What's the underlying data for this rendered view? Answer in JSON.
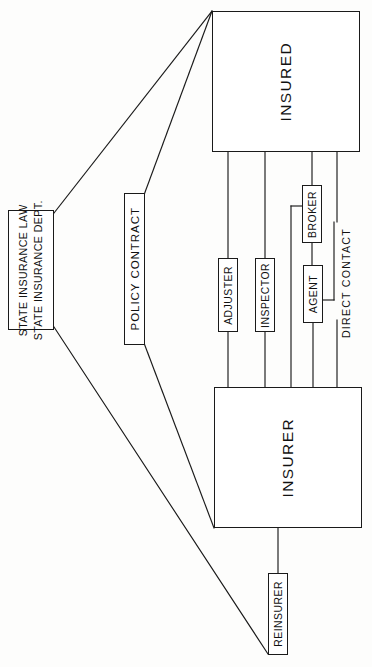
{
  "diagram": {
    "stroke_color": "#1a1a1a",
    "background_color": "#fdfdfc",
    "nodes": {
      "insured": {
        "label": "INSURED"
      },
      "insurer": {
        "label": "INSURER"
      },
      "state": {
        "line1": "STATE INSURANCE LAW",
        "line2": "STATE INSURANCE DEPT."
      },
      "policy_contract": {
        "label": "POLICY CONTRACT"
      },
      "adjuster": {
        "label": "ADJUSTER"
      },
      "inspector": {
        "label": "INSPECTOR"
      },
      "broker": {
        "label": "BROKER"
      },
      "agent": {
        "label": "AGENT"
      },
      "reinsurer": {
        "label": "REINSURER"
      }
    },
    "labels": {
      "direct_contact": "DIRECT CONTACT"
    }
  }
}
